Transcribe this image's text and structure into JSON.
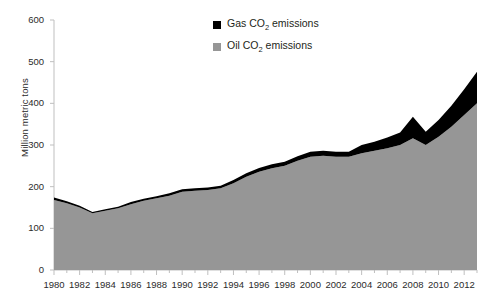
{
  "chart_data": {
    "type": "area",
    "stacked": true,
    "title": "",
    "xlabel": "",
    "ylabel": "Million metric tons",
    "ylim": [
      0,
      600
    ],
    "ytick_values": [
      0,
      100,
      200,
      300,
      400,
      500,
      600
    ],
    "ytick_labels": [
      "0",
      "100",
      "200",
      "300",
      "400",
      "500",
      "600"
    ],
    "xlim": [
      1980,
      2013
    ],
    "xtick_labels": [
      "1980",
      "1982",
      "1984",
      "1986",
      "1988",
      "1990",
      "1992",
      "1994",
      "1996",
      "1998",
      "2000",
      "2002",
      "2004",
      "2006",
      "2008",
      "2010",
      "2012"
    ],
    "x": [
      1980,
      1981,
      1982,
      1983,
      1984,
      1985,
      1986,
      1987,
      1988,
      1989,
      1990,
      1991,
      1992,
      1993,
      1994,
      1995,
      1996,
      1997,
      1998,
      1999,
      2000,
      2001,
      2002,
      2003,
      2004,
      2005,
      2006,
      2007,
      2008,
      2009,
      2010,
      2011,
      2012,
      2013
    ],
    "grid": false,
    "legend_position": "top-center",
    "series": [
      {
        "name": "Oil CO2 emissions",
        "legend_label": "Oil CO₂ emissions",
        "color": "#969696",
        "values": [
          168,
          160,
          150,
          136,
          142,
          148,
          158,
          166,
          172,
          178,
          188,
          190,
          192,
          196,
          208,
          224,
          236,
          244,
          250,
          262,
          272,
          274,
          272,
          272,
          280,
          286,
          292,
          300,
          316,
          300,
          320,
          344,
          372,
          400
        ]
      },
      {
        "name": "Gas CO2 emissions",
        "legend_label": "Gas CO₂ emissions",
        "color": "#000000",
        "values": [
          6,
          5,
          4,
          3,
          4,
          4,
          5,
          5,
          5,
          6,
          6,
          6,
          6,
          6,
          8,
          8,
          9,
          10,
          10,
          11,
          12,
          12,
          12,
          12,
          20,
          22,
          26,
          30,
          52,
          32,
          40,
          50,
          62,
          76
        ]
      }
    ],
    "total_values": [
      174,
      165,
      154,
      139,
      146,
      152,
      163,
      171,
      177,
      184,
      194,
      196,
      198,
      202,
      216,
      232,
      245,
      254,
      260,
      273,
      284,
      286,
      284,
      284,
      300,
      308,
      318,
      330,
      368,
      332,
      360,
      394,
      434,
      476
    ]
  },
  "legend": {
    "items": [
      {
        "label_prefix": "Gas CO",
        "label_sub": "2",
        "label_suffix": " emissions",
        "color": "#000000"
      },
      {
        "label_prefix": "Oil CO",
        "label_sub": "2",
        "label_suffix": " emissions",
        "color": "#969696"
      }
    ]
  }
}
